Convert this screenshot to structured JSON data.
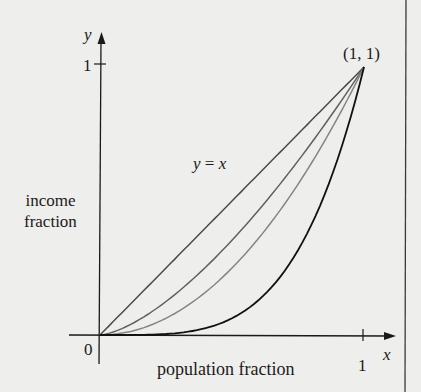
{
  "chart_data": {
    "type": "line",
    "title": "",
    "xlabel": "population fraction",
    "ylabel": "income fraction",
    "x_axis_name": "x",
    "y_axis_name": "y",
    "xlim": [
      0,
      1
    ],
    "ylim": [
      0,
      1
    ],
    "grid": false,
    "legend": null,
    "x_ticks": [
      "0",
      "1"
    ],
    "y_ticks": [
      "1"
    ],
    "annotations": [
      {
        "text": "(1, 1)",
        "x": 1,
        "y": 1
      },
      {
        "text": "y = x",
        "x": 0.42,
        "y": 0.64
      }
    ],
    "x": [
      0,
      0.1,
      0.2,
      0.3,
      0.4,
      0.5,
      0.6,
      0.7,
      0.8,
      0.9,
      1.0
    ],
    "series": [
      {
        "name": "y = x",
        "exponent": 1,
        "color": "#4a4a4a",
        "values": [
          0,
          0.1,
          0.2,
          0.3,
          0.4,
          0.5,
          0.6,
          0.7,
          0.8,
          0.9,
          1.0
        ]
      },
      {
        "name": "Lorenz curve 1",
        "exponent": 1.5,
        "color": "#606060",
        "values": [
          0,
          0.032,
          0.089,
          0.164,
          0.253,
          0.354,
          0.465,
          0.586,
          0.716,
          0.854,
          1.0
        ]
      },
      {
        "name": "Lorenz curve 2",
        "exponent": 2,
        "color": "#858585",
        "values": [
          0,
          0.01,
          0.04,
          0.09,
          0.16,
          0.25,
          0.36,
          0.49,
          0.64,
          0.81,
          1.0
        ]
      },
      {
        "name": "Lorenz curve 3",
        "exponent": 4,
        "color": "#111111",
        "values": [
          0,
          0.0001,
          0.0016,
          0.0081,
          0.0256,
          0.0625,
          0.1296,
          0.2401,
          0.4096,
          0.6561,
          1.0
        ]
      }
    ]
  },
  "labels": {
    "y_axis_name": "y",
    "x_axis_name": "x",
    "ytick_1": "1",
    "xtick_0": "0",
    "xtick_1": "1",
    "point": "(1, 1)",
    "line": "y = x",
    "ylabel_line1": "income",
    "ylabel_line2": "fraction",
    "xlabel": "population fraction"
  },
  "colors": {
    "background": "#eeeeec",
    "axis": "#1a1a1a",
    "frame_line": "#3a3a3a"
  }
}
